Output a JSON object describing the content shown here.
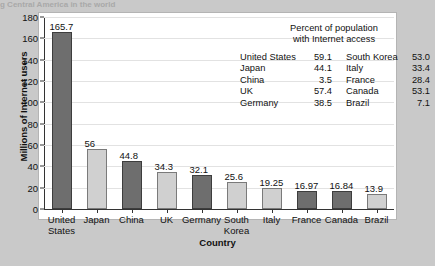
{
  "caption_strip": "g Central America in the world",
  "chart_data": {
    "type": "bar",
    "title": "",
    "xlabel": "Country",
    "ylabel": "Millions of Internet users",
    "ylim": [
      0,
      180
    ],
    "yticks": [
      0,
      20,
      40,
      60,
      80,
      100,
      120,
      140,
      160,
      180
    ],
    "grid": true,
    "legend_position": "inside-top-right",
    "categories": [
      "United States",
      "Japan",
      "China",
      "UK",
      "Germany",
      "South Korea",
      "Italy",
      "France",
      "Canada",
      "Brazil"
    ],
    "values": [
      165.7,
      56,
      44.8,
      34.3,
      32.1,
      25.6,
      19.25,
      16.97,
      16.84,
      13.9
    ],
    "value_labels": [
      "165.7",
      "56",
      "44.8",
      "34.3",
      "32.1",
      "25.6",
      "19.25",
      "16.97",
      "16.84",
      "13.9"
    ],
    "bar_shades": [
      "dark",
      "light",
      "dark",
      "light",
      "dark",
      "light",
      "light",
      "dark",
      "dark",
      "light"
    ],
    "annotation": {
      "title_line1": "Percent of population",
      "title_line2": "with Internet access",
      "left_column": [
        {
          "name": "United States",
          "value": "59.1"
        },
        {
          "name": "Japan",
          "value": "44.1"
        },
        {
          "name": "China",
          "value": "3.5"
        },
        {
          "name": "UK",
          "value": "57.4"
        },
        {
          "name": "Germany",
          "value": "38.5"
        }
      ],
      "right_column": [
        {
          "name": "South Korea",
          "value": "53.0"
        },
        {
          "name": "Italy",
          "value": "33.4"
        },
        {
          "name": "France",
          "value": "28.4"
        },
        {
          "name": "Canada",
          "value": "53.1"
        },
        {
          "name": "Brazil",
          "value": "7.1"
        }
      ]
    }
  },
  "colors": {
    "page_background": "#c9c9c9",
    "plot_background": "#ffffff",
    "bar_dark": "#6e6e6e",
    "bar_light": "#d0d0d0",
    "axis": "#333333",
    "gridline": "#e2e2e2"
  }
}
